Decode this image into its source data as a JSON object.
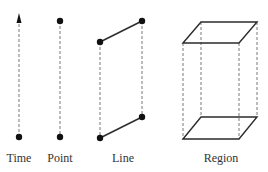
{
  "diagram": {
    "colors": {
      "line": "#2b2b2b",
      "dashed": "#6a6a6a",
      "dot": "#111111",
      "text": "#333333",
      "background": "#ffffff"
    },
    "panels": [
      {
        "id": "time",
        "label": "Time",
        "description": "Vertical dashed arrow pointing up with a dot at the base"
      },
      {
        "id": "point",
        "label": "Point",
        "description": "Dashed vertical segment connecting two dots"
      },
      {
        "id": "line",
        "label": "Line",
        "description": "Two solid slanted segments with dot endpoints joined by dashed verticals"
      },
      {
        "id": "region",
        "label": "Region",
        "description": "Box prism: solid top and bottom parallelograms joined by dashed vertical edges"
      }
    ]
  }
}
